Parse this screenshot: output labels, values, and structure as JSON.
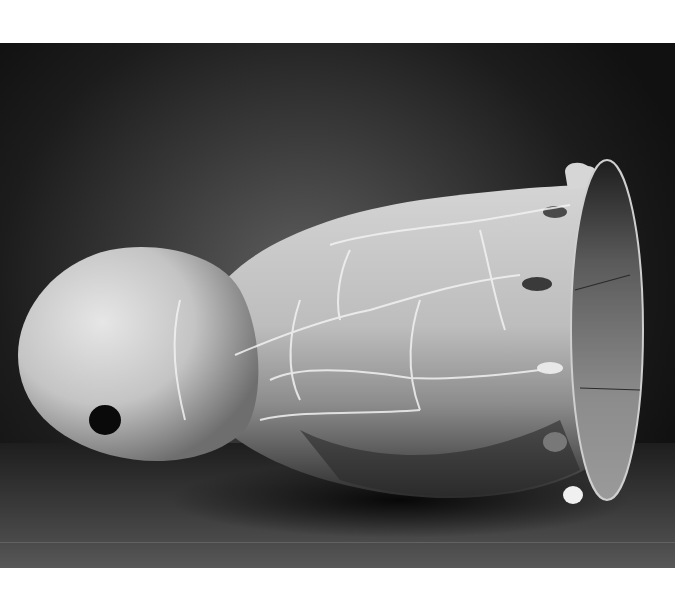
{
  "photo": {
    "subject": "ceramic vessel",
    "colors": {
      "background_dark": "#151515",
      "background_light": "#5e5e5e",
      "vessel_light": "#d8d8d8",
      "vessel_mid": "#a6a6a6",
      "vessel_shadow": "#3a3a3a",
      "interior": "#8a8a8a",
      "margin": "#ffffff"
    }
  }
}
